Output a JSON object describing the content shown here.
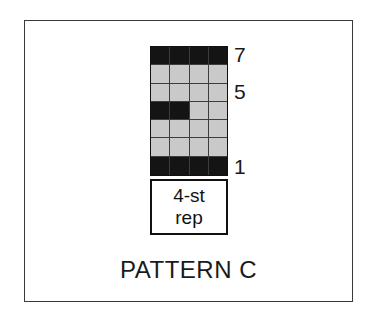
{
  "figure": {
    "caption": "PATTERN C",
    "frame_color": "#3a3a3a",
    "background_color": "#ffffff"
  },
  "repeat_box": {
    "line1": "4-st",
    "line2": "rep"
  },
  "row_labels": [
    {
      "text": "7",
      "row": 7
    },
    {
      "text": "5",
      "row": 5
    },
    {
      "text": "1",
      "row": 1
    }
  ],
  "chart_data": {
    "type": "heatmap",
    "title": "PATTERN C",
    "xlabel": "",
    "ylabel": "",
    "columns": 4,
    "rows": 7,
    "x": [
      1,
      2,
      3,
      4
    ],
    "categories": [
      "st 1",
      "st 2",
      "st 3",
      "st 4"
    ],
    "tick_labels_y": [
      "7",
      "5",
      "1"
    ],
    "legend": [
      {
        "name": "dark",
        "color": "#141414",
        "value": 1
      },
      {
        "name": "light",
        "color": "#c9c9c9",
        "value": 0
      }
    ],
    "legend_position": "none",
    "grid": true,
    "annotations": [
      "4-st rep",
      "PATTERN C"
    ],
    "grid_rows_top_to_bottom": [
      {
        "row": 7,
        "cells": [
          "dark",
          "dark",
          "dark",
          "dark"
        ]
      },
      {
        "row": 6,
        "cells": [
          "light",
          "light",
          "light",
          "light"
        ]
      },
      {
        "row": 5,
        "cells": [
          "light",
          "light",
          "light",
          "light"
        ]
      },
      {
        "row": 4,
        "cells": [
          "dark",
          "dark",
          "light",
          "light"
        ]
      },
      {
        "row": 3,
        "cells": [
          "light",
          "light",
          "light",
          "light"
        ]
      },
      {
        "row": 2,
        "cells": [
          "light",
          "light",
          "light",
          "light"
        ]
      },
      {
        "row": 1,
        "cells": [
          "dark",
          "dark",
          "dark",
          "dark"
        ]
      }
    ],
    "values_top_to_bottom": [
      [
        1,
        1,
        1,
        1
      ],
      [
        0,
        0,
        0,
        0
      ],
      [
        0,
        0,
        0,
        0
      ],
      [
        1,
        1,
        0,
        0
      ],
      [
        0,
        0,
        0,
        0
      ],
      [
        0,
        0,
        0,
        0
      ],
      [
        1,
        1,
        1,
        1
      ]
    ]
  }
}
